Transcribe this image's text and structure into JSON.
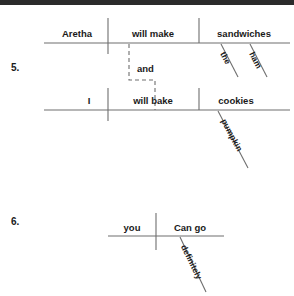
{
  "page": {
    "background": "#ffffff",
    "ink": "#1a1a1a",
    "rule_color": "#6e6e6e",
    "top_band_color": "#2b2b2b"
  },
  "exercises": [
    {
      "number": "5.",
      "type": "compound-sentence-diagram",
      "clauses": [
        {
          "subject": "Aretha",
          "verb": "will make",
          "object": "sandwiches",
          "modifiers": [
            "the",
            "ham"
          ]
        },
        {
          "subject": "I",
          "verb": "will bake",
          "object": "cookies",
          "modifiers": [
            "pumpkin"
          ]
        }
      ],
      "conjunction": "and"
    },
    {
      "number": "6.",
      "type": "simple-sentence-diagram",
      "clauses": [
        {
          "subject": "you",
          "verb": "Can go",
          "object": "",
          "modifiers": [
            "definitely"
          ]
        }
      ],
      "conjunction": ""
    }
  ],
  "labels": {
    "ex5_number": "5.",
    "ex5_c1_subject": "Aretha",
    "ex5_c1_verb": "will make",
    "ex5_c1_object": "sandwiches",
    "ex5_c1_mod1": "the",
    "ex5_c1_mod2": "ham",
    "ex5_conjunction": "and",
    "ex5_c2_subject": "I",
    "ex5_c2_verb": "will bake",
    "ex5_c2_object": "cookies",
    "ex5_c2_mod1": "pumpkin",
    "ex6_number": "6.",
    "ex6_subject": "you",
    "ex6_verb": "Can go",
    "ex6_mod1": "definitely"
  }
}
